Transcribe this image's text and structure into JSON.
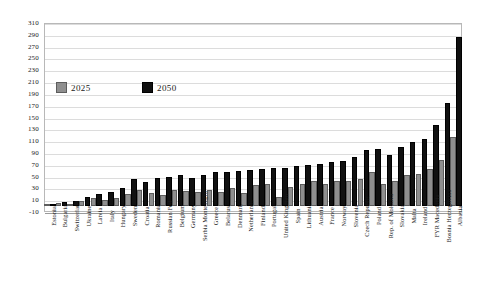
{
  "chart_data": {
    "type": "bar",
    "title": "",
    "subtitle": "",
    "xlabel": "",
    "ylabel": "",
    "ylim": [
      -10,
      310
    ],
    "ytick_step": 20,
    "yticks": [
      "310",
      "290",
      "270",
      "250",
      "230",
      "210",
      "190",
      "170",
      "150",
      "130",
      "110",
      "90",
      "70",
      "50",
      "30",
      "10",
      "-10"
    ],
    "grid": true,
    "legend_position": "inside-upper-left",
    "categories": [
      "Estonia",
      "Bulgaria",
      "Switzerland",
      "Ukraine",
      "Latvia",
      "Italy",
      "Hungary",
      "Sweden",
      "Croatia",
      "Romania",
      "Russian Fed.",
      "Belgium",
      "Germany",
      "Serbia Montenegro",
      "Greece",
      "Belarus",
      "Denmark",
      "Netherlands",
      "Finland",
      "Portugal",
      "United Kingdom",
      "Spain",
      "Lithuania",
      "Austria",
      "France",
      "Norway",
      "Slovenia",
      "Czech Republic",
      "Poland",
      "Rep. of Moldova",
      "Slovakia",
      "Malta",
      "Ireland",
      "FYR Macedonia",
      "Bosnia Herzegovina",
      "Albania"
    ],
    "series": [
      {
        "name": "2025",
        "color": "#8f8f8f",
        "values": [
          2,
          5,
          3,
          8,
          14,
          10,
          14,
          20,
          28,
          22,
          18,
          28,
          25,
          24,
          28,
          24,
          30,
          22,
          35,
          37,
          15,
          32,
          37,
          42,
          38,
          42,
          43,
          46,
          57,
          37,
          43,
          52,
          54,
          62,
          78,
          117
        ]
      },
      {
        "name": "2050",
        "color": "#111111",
        "values": [
          4,
          7,
          8,
          15,
          20,
          24,
          30,
          46,
          41,
          48,
          50,
          52,
          48,
          52,
          57,
          57,
          60,
          61,
          62,
          64,
          65,
          68,
          70,
          72,
          74,
          76,
          83,
          95,
          96,
          86,
          100,
          108,
          113,
          138,
          174,
          287
        ]
      }
    ]
  },
  "legend": {
    "items": [
      {
        "label": "2025",
        "swatch": "s2025"
      },
      {
        "label": "2050",
        "swatch": "s2050"
      }
    ]
  }
}
